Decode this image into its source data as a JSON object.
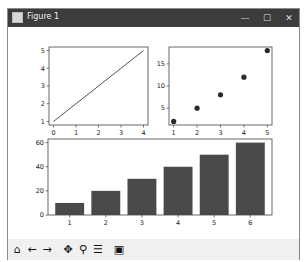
{
  "window": {
    "title": "Figure 1",
    "controls": {
      "minimize": "—",
      "maximize": "☐",
      "close": "✕"
    }
  },
  "toolbar": {
    "buttons": [
      {
        "name": "home",
        "glyph": "⌂"
      },
      {
        "name": "back",
        "glyph": "←"
      },
      {
        "name": "forward",
        "glyph": "→"
      },
      {
        "name": "pan",
        "glyph": "✥"
      },
      {
        "name": "zoom",
        "glyph": "⚲"
      },
      {
        "name": "configure-subplots",
        "glyph": "☰"
      },
      {
        "name": "save",
        "glyph": "▣"
      }
    ]
  },
  "colors": {
    "titlebar": "#3c3c3c",
    "series": "#404040",
    "bar": "#4a4a4a",
    "axis": "#444444"
  },
  "chart_data": [
    {
      "type": "line",
      "title": "",
      "x": [
        0,
        1,
        2,
        3,
        4
      ],
      "series": [
        {
          "name": "line",
          "values": [
            1,
            2,
            3,
            4,
            5
          ]
        }
      ],
      "xticks": [
        "0",
        "1",
        "2",
        "3",
        "4"
      ],
      "yticks": [
        "1",
        "2",
        "3",
        "4",
        "5"
      ],
      "xlim": [
        -0.2,
        4.2
      ],
      "ylim": [
        0.8,
        5.2
      ],
      "xlabel": "",
      "ylabel": "",
      "grid": false
    },
    {
      "type": "scatter",
      "title": "",
      "x": [
        1,
        2,
        3,
        4,
        5
      ],
      "series": [
        {
          "name": "points",
          "values": [
            2,
            5,
            8,
            12,
            18
          ]
        }
      ],
      "xticks": [
        "1",
        "2",
        "3",
        "4",
        "5"
      ],
      "yticks": [
        "5",
        "10",
        "15"
      ],
      "xlim": [
        0.8,
        5.2
      ],
      "ylim": [
        1.2,
        18.8
      ],
      "xlabel": "",
      "ylabel": "",
      "grid": false
    },
    {
      "type": "bar",
      "title": "",
      "categories": [
        "1",
        "2",
        "3",
        "4",
        "5",
        "6"
      ],
      "values": [
        10,
        20,
        30,
        40,
        50,
        60
      ],
      "yticks": [
        "0",
        "20",
        "40",
        "60"
      ],
      "ylim": [
        0,
        63
      ],
      "xlabel": "",
      "ylabel": "",
      "grid": false
    }
  ]
}
